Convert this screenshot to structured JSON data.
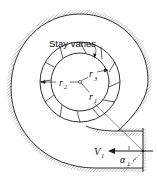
{
  "diagram": {
    "type": "spiral casing with stay vanes (plan view)",
    "labels": {
      "stay_vanes": "Stay vanes",
      "r1": "r",
      "r1_sub": "1",
      "r2": "r",
      "r2_sub": "2",
      "r3": "r",
      "r3_sub": "3",
      "v1": "V",
      "v1_sub": "1",
      "alpha1": "α",
      "alpha1_sub": "1"
    },
    "colors": {
      "stroke": "#1a1a1a",
      "hatch": "#777777",
      "background": "#ffffff"
    }
  }
}
